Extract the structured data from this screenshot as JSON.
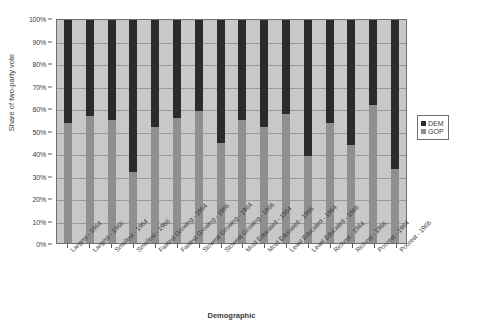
{
  "chart_data": {
    "type": "bar",
    "subtype": "stacked-100-percent",
    "title": "",
    "xlabel": "Demographic",
    "ylabel": "Share of two-party vote",
    "ylim": [
      0,
      100
    ],
    "ytick_labels": [
      "0%",
      "10%",
      "20%",
      "30%",
      "40%",
      "50%",
      "60%",
      "70%",
      "80%",
      "90%",
      "100%"
    ],
    "ytick_values": [
      0,
      10,
      20,
      30,
      40,
      50,
      60,
      70,
      80,
      90,
      100
    ],
    "grid": true,
    "legend_position": "right",
    "categories": [
      "Largest - 1964",
      "Largest - 1966",
      "Smallest - 1964",
      "Smallest - 1966",
      "Fastest Growing - 1964",
      "Fastest Growing - 1966",
      "Slowest Growing - 1964",
      "Slowest Growing - 1966",
      "Most Educated - 1964",
      "Most Educated - 1966",
      "Least Educated - 1964",
      "Least Educated - 1966",
      "Richest - 1964",
      "Richest - 1966",
      "Poorest - 1964",
      "Poorest - 1966"
    ],
    "series": [
      {
        "name": "GOP",
        "color": "#8f8f8f",
        "values": [
          54,
          57,
          55,
          32,
          52,
          56,
          59,
          45,
          55,
          52,
          58,
          39,
          54,
          44,
          62,
          33
        ]
      },
      {
        "name": "DEM",
        "color": "#2b2b2b",
        "values": [
          46,
          43,
          45,
          68,
          48,
          44,
          41,
          55,
          45,
          48,
          42,
          61,
          46,
          56,
          38,
          67
        ]
      }
    ]
  },
  "legend": {
    "entries": [
      {
        "label": "DEM",
        "color": "#2b2b2b"
      },
      {
        "label": "GOP",
        "color": "#8f8f8f"
      }
    ]
  }
}
